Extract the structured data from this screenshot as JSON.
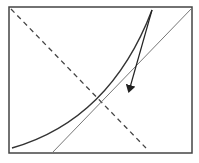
{
  "diagram": {
    "width": 199,
    "height": 163,
    "frame": {
      "x": 9,
      "y": 7,
      "w": 183,
      "h": 146,
      "stroke": "#444444"
    },
    "dashed_line": {
      "x1": 11,
      "y1": 9,
      "x2": 146,
      "y2": 148,
      "stroke": "#444444"
    },
    "gray_line": {
      "x1": 192,
      "y1": 8,
      "x2": 52,
      "y2": 153,
      "stroke": "#777777"
    },
    "curve": {
      "d": "M 12 148 Q 110 120 152 10",
      "stroke": "#333333"
    },
    "arrow": {
      "x1": 152,
      "y1": 10,
      "x2": 129,
      "y2": 91,
      "stroke": "#222222"
    }
  }
}
